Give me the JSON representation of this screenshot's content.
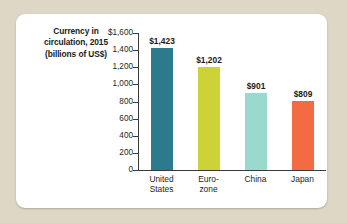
{
  "chart_data": {
    "type": "bar",
    "title": "Currency in circulation, 2015 (billions of US$)",
    "title_lines": [
      "Currency in",
      "circulation, 2015",
      "(billions of US$)"
    ],
    "xlabel": "",
    "ylabel": "",
    "ylim": [
      0,
      1600
    ],
    "grid": false,
    "legend": "none",
    "y_ticks": [
      {
        "value": 1600,
        "label": "$1,600"
      },
      {
        "value": 1400,
        "label": "1,400"
      },
      {
        "value": 1200,
        "label": "1,200"
      },
      {
        "value": 1000,
        "label": "1,000"
      },
      {
        "value": 800,
        "label": "800"
      },
      {
        "value": 600,
        "label": "600"
      },
      {
        "value": 400,
        "label": "400"
      },
      {
        "value": 200,
        "label": "200"
      },
      {
        "value": 0,
        "label": "0"
      }
    ],
    "categories": [
      "United States",
      "Euro-zone",
      "China",
      "Japan"
    ],
    "category_label_lines": [
      [
        "United",
        "States"
      ],
      [
        "Euro-",
        "zone"
      ],
      [
        "China"
      ],
      [
        "Japan"
      ]
    ],
    "values": [
      1423,
      1202,
      901,
      809
    ],
    "value_labels": [
      "$1,423",
      "$1,202",
      "$901",
      "$809"
    ],
    "colors": [
      "#2c7b8c",
      "#ccd337",
      "#9bd8cd",
      "#f26b43"
    ],
    "background_color": "#ffffff",
    "page_background_color": "#ded7c6",
    "axis_color": "#3b3b3b"
  }
}
